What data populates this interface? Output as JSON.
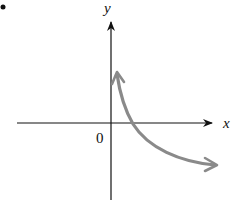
{
  "diagram": {
    "type": "coordinate-graph",
    "bullet": "•",
    "x_axis_label": "x",
    "y_axis_label": "y",
    "origin_label": "0",
    "curve": {
      "description": "decreasing curve approaching y-axis upward and x-axis downward-right",
      "color": "#8a8a8a",
      "start_arrow": true,
      "end_arrow": true
    },
    "axis_color": "#111111"
  }
}
